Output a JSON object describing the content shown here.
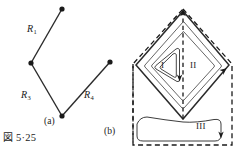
{
  "figure": {
    "caption_kanji": "図",
    "caption_number": "5·25",
    "caption_full": "図 5·25"
  },
  "part_a": {
    "sublabel": "(a)",
    "resistor_labels": [
      {
        "name": "R1",
        "letter": "R",
        "subscript": "1"
      },
      {
        "name": "R3",
        "letter": "R",
        "subscript": "3"
      },
      {
        "name": "R4",
        "letter": "R",
        "subscript": "4"
      }
    ],
    "node_count": 4
  },
  "part_b": {
    "sublabel": "(b)",
    "region_labels": [
      {
        "name": "region-one",
        "text": "I"
      },
      {
        "name": "region-two",
        "text": "II"
      },
      {
        "name": "region-three",
        "text": "III"
      }
    ]
  },
  "colors": {
    "ink": "#1a1a1a",
    "line": "#2b2b2b",
    "thin": "#555555",
    "background": "#ffffff"
  }
}
